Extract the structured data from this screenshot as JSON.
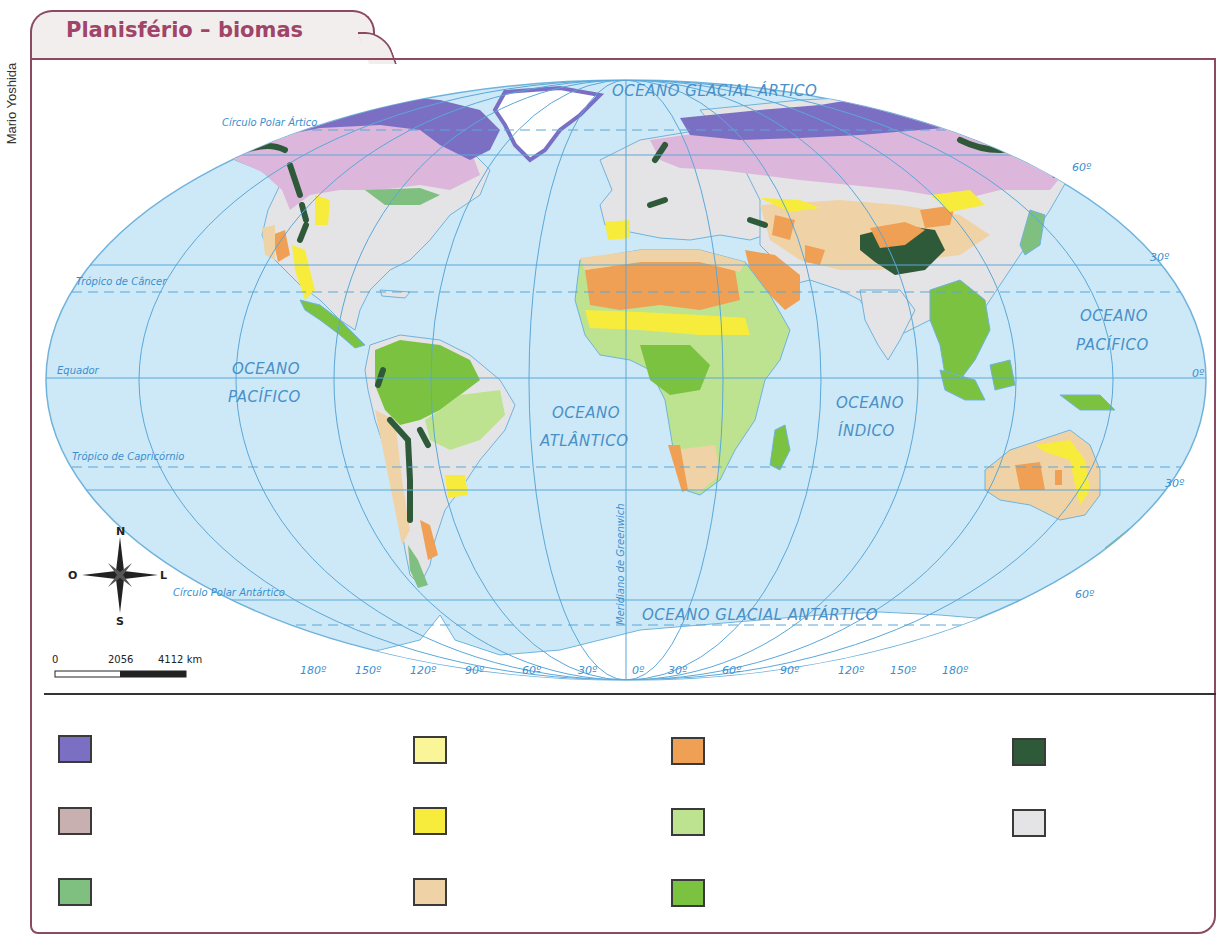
{
  "credit": "Mario Yoshida",
  "title": "Planisfério – biomas",
  "map": {
    "oceans": {
      "arctic": "OCEANO GLACIAL ÁRTICO",
      "pacific_west_1": "OCEANO",
      "pacific_west_2": "PACÍFICO",
      "atlantic_1": "OCEANO",
      "atlantic_2": "ATLÂNTICO",
      "indian_1": "OCEANO",
      "indian_2": "ÍNDICO",
      "pacific_east_1": "OCEANO",
      "pacific_east_2": "PACÍFICO",
      "antarctic": "OCEANO GLACIAL ANTÁRTICO"
    },
    "lines": {
      "arctic_circle": "Círculo Polar Ártico",
      "tropic_cancer": "Trópico de Câncer",
      "equator": "Equador",
      "tropic_capricorn": "Trópico de Capricórnio",
      "antarctic_circle": "Círculo Polar Antártico",
      "greenwich": "Meridiano de Greenwich"
    },
    "latitude_labels": {
      "n60": "60º",
      "n30": "30º",
      "eq": "0º",
      "s30": "30º",
      "s60": "60º"
    },
    "longitude_labels": [
      "180º",
      "150º",
      "120º",
      "90º",
      "60º",
      "30º",
      "0º",
      "30º",
      "60º",
      "90º",
      "120º",
      "150º",
      "180º"
    ],
    "compass": {
      "n": "N",
      "s": "S",
      "e": "L",
      "w": "O"
    },
    "scale": {
      "zero": "0",
      "mid": "2056",
      "end": "4112 km"
    }
  },
  "legend": {
    "items": [
      {
        "color": "#7b6fc4",
        "label": ""
      },
      {
        "color": "#c9b0b0",
        "label": ""
      },
      {
        "color": "#7fbf7f",
        "label": ""
      },
      {
        "color": "#fbf59a",
        "label": ""
      },
      {
        "color": "#f7ec3c",
        "label": ""
      },
      {
        "color": "#efd3a6",
        "label": ""
      },
      {
        "color": "#f0a055",
        "label": ""
      },
      {
        "color": "#bde391",
        "label": ""
      },
      {
        "color": "#7cc241",
        "label": ""
      },
      {
        "color": "#2f5a3a",
        "label": ""
      },
      {
        "color": "#e4e4e6",
        "label": ""
      }
    ]
  },
  "colors": {
    "frame": "#8a4a62",
    "title": "#a04468",
    "ocean": "#cde9f7",
    "grid": "#5aa7d8"
  }
}
